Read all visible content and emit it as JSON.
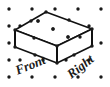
{
  "figure": {
    "type": "isometric-solid-drawing",
    "title": "",
    "background_color": "#ffffff",
    "ink_color": "#111111",
    "grid": {
      "name": "isometric-dot-grid",
      "dot_color": "#1a1a1a",
      "dot_radius": 1.7,
      "columns": 5,
      "rows": 5,
      "x_start": 9,
      "x_step": 23,
      "y_start": 9,
      "y_step": 17,
      "stagger_x": 11.5,
      "points": [
        {
          "x": 9,
          "y": 9
        },
        {
          "x": 32,
          "y": 9
        },
        {
          "x": 55,
          "y": 9
        },
        {
          "x": 78,
          "y": 9
        },
        {
          "x": 101,
          "y": 9
        },
        {
          "x": 20,
          "y": 26
        },
        {
          "x": 43,
          "y": 26
        },
        {
          "x": 66,
          "y": 26
        },
        {
          "x": 89,
          "y": 26
        },
        {
          "x": 9,
          "y": 26
        },
        {
          "x": 9,
          "y": 43
        },
        {
          "x": 32,
          "y": 43
        },
        {
          "x": 55,
          "y": 43
        },
        {
          "x": 78,
          "y": 43
        },
        {
          "x": 101,
          "y": 43
        },
        {
          "x": 20,
          "y": 60
        },
        {
          "x": 43,
          "y": 60
        },
        {
          "x": 66,
          "y": 60
        },
        {
          "x": 89,
          "y": 60
        },
        {
          "x": 9,
          "y": 60
        },
        {
          "x": 9,
          "y": 77
        },
        {
          "x": 32,
          "y": 77
        },
        {
          "x": 55,
          "y": 77
        },
        {
          "x": 78,
          "y": 77
        },
        {
          "x": 101,
          "y": 77
        }
      ]
    },
    "solid": {
      "name": "rectangular-prism",
      "dimensions": {
        "length": 3,
        "width": 2,
        "height": 1
      },
      "stroke_width": 1.6,
      "fill": "#ffffff",
      "vertices": {
        "top_back": {
          "x": 46,
          "y": 12
        },
        "top_right": {
          "x": 92,
          "y": 29
        },
        "top_front": {
          "x": 57,
          "y": 46
        },
        "top_left": {
          "x": 15,
          "y": 30
        },
        "bottom_front": {
          "x": 57,
          "y": 63
        },
        "bottom_left": {
          "x": 15,
          "y": 47
        },
        "bottom_right": {
          "x": 92,
          "y": 46
        }
      },
      "edge_dots": [
        {
          "x": 46,
          "y": 12
        },
        {
          "x": 69,
          "y": 20
        },
        {
          "x": 92,
          "y": 29
        },
        {
          "x": 80,
          "y": 37
        },
        {
          "x": 57,
          "y": 46
        },
        {
          "x": 34,
          "y": 38
        },
        {
          "x": 15,
          "y": 30
        },
        {
          "x": 31,
          "y": 21
        },
        {
          "x": 15,
          "y": 47
        },
        {
          "x": 57,
          "y": 63
        },
        {
          "x": 92,
          "y": 46
        },
        {
          "x": 74,
          "y": 55
        },
        {
          "x": 35,
          "y": 55
        },
        {
          "x": 53,
          "y": 29
        },
        {
          "x": 68,
          "y": 37
        },
        {
          "x": 38,
          "y": 21
        }
      ],
      "interior_dots": [
        {
          "x": 53,
          "y": 29
        },
        {
          "x": 38,
          "y": 21
        },
        {
          "x": 68,
          "y": 37
        }
      ]
    },
    "labels": [
      {
        "name": "front-face-label",
        "text": "Front",
        "x": 32,
        "y": 69,
        "rotation_deg": -22,
        "font_size": 13
      },
      {
        "name": "right-face-label",
        "text": "Right",
        "x": 83,
        "y": 70,
        "rotation_deg": -38,
        "font_size": 13
      }
    ]
  }
}
